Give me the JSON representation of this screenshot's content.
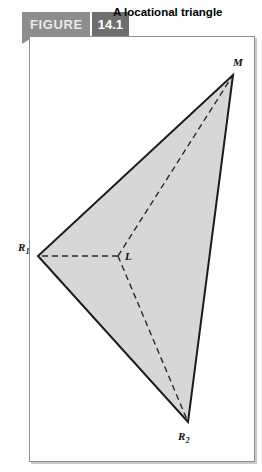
{
  "header": {
    "tab_label": "FIGURE",
    "figure_number": "14.1",
    "title": "A locational triangle"
  },
  "figure": {
    "caption": "A locational triangle",
    "vertices": [
      {
        "id": "M",
        "label": "M",
        "sub": "",
        "x": 233,
        "y": 75
      },
      {
        "id": "R1",
        "label": "R",
        "sub": "1",
        "x": 38,
        "y": 256
      },
      {
        "id": "R2",
        "label": "R",
        "sub": "2",
        "x": 188,
        "y": 422
      }
    ],
    "interior_point": {
      "id": "L",
      "label": "L",
      "sub": "",
      "x": 118,
      "y": 256
    },
    "colors": {
      "fill": "#d7d7d7",
      "outline": "#1c1c1c",
      "dashed": "#2b2b2b",
      "tab_gray": "#8d8d8d",
      "tab_number_gray": "#6f6f6f",
      "frame_border": "#8e8e8e",
      "page_background": "#fdfdfd"
    }
  }
}
